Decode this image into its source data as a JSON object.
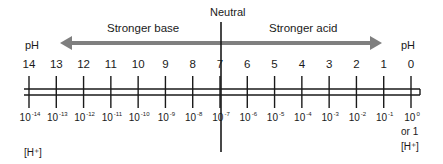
{
  "diagram": {
    "neutral_label": "Neutral",
    "base_label": "Stronger base",
    "acid_label": "Stronger acid",
    "ph_label_left": "pH",
    "ph_label_right": "pH",
    "h_label_left": "[H⁺]",
    "h_label_right": "[H⁺]",
    "or_one": "or 1",
    "colors": {
      "arrow": "#7f7f7f",
      "lines": "#1a1a1a",
      "text": "#1a1a1a"
    },
    "ticks": [
      {
        "ph": "14",
        "base": "10",
        "exp": "-14"
      },
      {
        "ph": "13",
        "base": "10",
        "exp": "-13"
      },
      {
        "ph": "12",
        "base": "10",
        "exp": "-12"
      },
      {
        "ph": "11",
        "base": "10",
        "exp": "-11"
      },
      {
        "ph": "10",
        "base": "10",
        "exp": "-10"
      },
      {
        "ph": "9",
        "base": "10",
        "exp": "-9"
      },
      {
        "ph": "8",
        "base": "10",
        "exp": "-8"
      },
      {
        "ph": "7",
        "base": "10",
        "exp": "-7"
      },
      {
        "ph": "6",
        "base": "10",
        "exp": "-6"
      },
      {
        "ph": "5",
        "base": "10",
        "exp": "-5"
      },
      {
        "ph": "4",
        "base": "10",
        "exp": "-4"
      },
      {
        "ph": "3",
        "base": "10",
        "exp": "-3"
      },
      {
        "ph": "2",
        "base": "10",
        "exp": "-2"
      },
      {
        "ph": "1",
        "base": "10",
        "exp": "-1"
      },
      {
        "ph": "0",
        "base": "10",
        "exp": "0"
      }
    ]
  }
}
